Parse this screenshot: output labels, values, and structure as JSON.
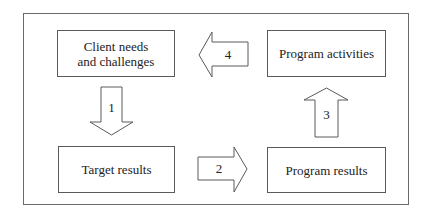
{
  "diagram": {
    "type": "cycle-flow",
    "boxes": [
      {
        "id": "client-needs",
        "lines": [
          "Client needs",
          "and challenges"
        ]
      },
      {
        "id": "program-activities",
        "lines": [
          "Program activities"
        ]
      },
      {
        "id": "target-results",
        "lines": [
          "Target results"
        ]
      },
      {
        "id": "program-results",
        "lines": [
          "Program results"
        ]
      }
    ],
    "arrows": [
      {
        "label": "1",
        "from": "client-needs",
        "to": "target-results",
        "direction": "down"
      },
      {
        "label": "2",
        "from": "target-results",
        "to": "program-results",
        "direction": "right"
      },
      {
        "label": "3",
        "from": "program-results",
        "to": "program-activities",
        "direction": "up"
      },
      {
        "label": "4",
        "from": "program-activities",
        "to": "client-needs",
        "direction": "left"
      }
    ],
    "colors": {
      "stroke": "#5a5a5a",
      "text": "#222222",
      "background": "#ffffff"
    }
  }
}
